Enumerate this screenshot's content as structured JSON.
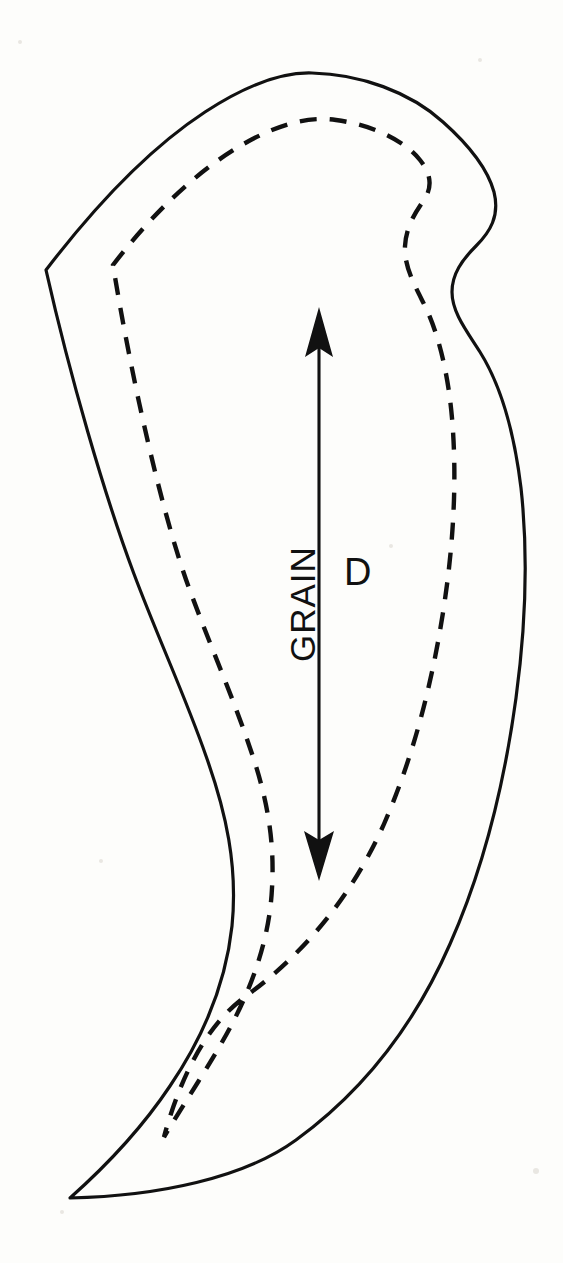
{
  "document": {
    "type": "sewing-pattern-piece",
    "background_color": "#fdfdfb",
    "ink_color": "#111111",
    "width": 563,
    "height": 1263
  },
  "annotations": {
    "grain_label": "GRAIN",
    "dimension_label": "D"
  },
  "lines": {
    "cutting_line": {
      "name": "outer cutting line",
      "style": "solid",
      "stroke_width": 3.2
    },
    "seam_line": {
      "name": "inner seam / stitching line",
      "style": "dashed",
      "stroke_width": 4.2,
      "dash_pattern": "16 12"
    },
    "grain_arrow": {
      "name": "grain line double arrow",
      "style": "solid",
      "stroke_width": 3.0,
      "top_point_y": 308,
      "bottom_point_y": 880,
      "x": 319
    }
  },
  "geometry": {
    "outer_path": "M 46 270 C 120 180 215 96 300 76 C 365 62 430 82 466 118 C 492 144 500 168 494 192 C 486 222 462 236 456 262 C 450 292 470 312 488 342 C 512 382 525 450 524 540 C 523 660 500 800 455 920 C 412 1034 340 1118 250 1168 C 200 1196 132 1206 70 1198 C 130 1150 180 1086 211 1010 C 240 938 232 866 214 800 C 196 734 170 672 146 600 C 112 498 72 376 46 270 Z",
    "seam_path": "M 113 265 C 170 200 240 146 310 130 C 360 119 404 130 424 152 C 434 163 436 176 433 190 C 427 216 410 232 406 256 C 401 284 416 306 428 334 C 446 376 456 440 455 520 C 454 628 434 752 396 860 C 362 956 300 1030 222 1074 C 196 1090 176 1110 164 1137 C 198 1092 230 1040 250 982 C 274 914 268 848 250 786 C 232 724 206 664 184 596 C 153 500 128 372 113 265 Z"
  },
  "paper_marks": [
    {
      "x": 18,
      "y": 40,
      "r": 2
    },
    {
      "x": 535,
      "y": 1170,
      "r": 3
    },
    {
      "x": 60,
      "y": 1210,
      "r": 2
    },
    {
      "x": 480,
      "y": 60,
      "r": 2
    },
    {
      "x": 390,
      "y": 545,
      "r": 2
    },
    {
      "x": 100,
      "y": 860,
      "r": 2
    }
  ]
}
